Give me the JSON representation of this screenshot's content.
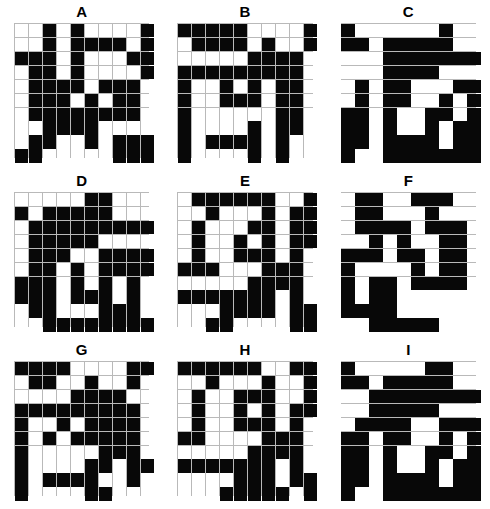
{
  "figure": {
    "title": "",
    "grid_size": 10,
    "panel_count": 9,
    "colors": {
      "filled": "#080808",
      "empty": "#ffffff",
      "gridline": "#b9b9b9",
      "label": "#000000"
    }
  },
  "panels": [
    {
      "label": "A",
      "rows": [
        [
          0,
          0,
          1,
          0,
          1,
          0,
          0,
          0,
          0,
          1
        ],
        [
          0,
          0,
          1,
          0,
          1,
          1,
          1,
          1,
          0,
          1
        ],
        [
          1,
          1,
          1,
          0,
          1,
          0,
          0,
          0,
          1,
          1
        ],
        [
          0,
          1,
          1,
          0,
          1,
          0,
          0,
          0,
          0,
          1
        ],
        [
          0,
          1,
          1,
          1,
          1,
          0,
          1,
          1,
          1,
          0
        ],
        [
          0,
          1,
          1,
          1,
          0,
          1,
          0,
          1,
          1,
          0
        ],
        [
          0,
          1,
          1,
          1,
          1,
          1,
          1,
          1,
          1,
          0
        ],
        [
          0,
          0,
          1,
          1,
          1,
          1,
          0,
          0,
          0,
          0
        ],
        [
          0,
          1,
          1,
          0,
          0,
          1,
          0,
          1,
          1,
          1
        ],
        [
          1,
          1,
          0,
          0,
          0,
          0,
          0,
          1,
          1,
          1
        ]
      ]
    },
    {
      "label": "B",
      "rows": [
        [
          1,
          1,
          1,
          1,
          1,
          0,
          0,
          0,
          0,
          1
        ],
        [
          0,
          1,
          1,
          1,
          1,
          0,
          1,
          0,
          0,
          1
        ],
        [
          0,
          0,
          0,
          0,
          0,
          1,
          1,
          1,
          1,
          0
        ],
        [
          1,
          1,
          1,
          1,
          1,
          1,
          1,
          1,
          1,
          0
        ],
        [
          1,
          0,
          0,
          1,
          0,
          1,
          0,
          1,
          1,
          0
        ],
        [
          1,
          0,
          0,
          1,
          1,
          1,
          0,
          1,
          1,
          0
        ],
        [
          1,
          0,
          0,
          0,
          0,
          0,
          0,
          1,
          1,
          0
        ],
        [
          1,
          0,
          0,
          0,
          0,
          1,
          0,
          1,
          1,
          0
        ],
        [
          1,
          0,
          1,
          1,
          1,
          1,
          0,
          1,
          0,
          0
        ],
        [
          1,
          0,
          0,
          0,
          0,
          1,
          0,
          1,
          0,
          0
        ]
      ]
    },
    {
      "label": "C",
      "rows": [
        [
          1,
          0,
          0,
          0,
          0,
          0,
          0,
          1,
          0,
          0
        ],
        [
          1,
          1,
          0,
          1,
          1,
          1,
          1,
          1,
          0,
          0
        ],
        [
          0,
          0,
          0,
          1,
          1,
          1,
          1,
          1,
          1,
          1
        ],
        [
          0,
          0,
          0,
          1,
          1,
          1,
          1,
          0,
          0,
          0
        ],
        [
          0,
          1,
          0,
          1,
          1,
          0,
          0,
          0,
          1,
          1
        ],
        [
          0,
          1,
          0,
          1,
          1,
          0,
          0,
          1,
          0,
          1
        ],
        [
          1,
          1,
          0,
          1,
          0,
          0,
          1,
          1,
          0,
          1
        ],
        [
          1,
          1,
          0,
          1,
          0,
          0,
          1,
          0,
          1,
          1
        ],
        [
          1,
          1,
          0,
          1,
          1,
          1,
          1,
          0,
          1,
          1
        ],
        [
          1,
          0,
          0,
          1,
          1,
          1,
          1,
          1,
          1,
          1
        ]
      ]
    },
    {
      "label": "D",
      "rows": [
        [
          0,
          0,
          0,
          0,
          0,
          1,
          1,
          0,
          0,
          0
        ],
        [
          1,
          0,
          1,
          1,
          1,
          1,
          1,
          0,
          0,
          0
        ],
        [
          0,
          1,
          1,
          1,
          1,
          1,
          1,
          1,
          1,
          1
        ],
        [
          0,
          1,
          1,
          1,
          1,
          1,
          0,
          0,
          0,
          0
        ],
        [
          0,
          1,
          1,
          1,
          0,
          0,
          1,
          1,
          1,
          1
        ],
        [
          0,
          1,
          1,
          0,
          1,
          0,
          1,
          1,
          1,
          1
        ],
        [
          1,
          1,
          1,
          0,
          1,
          0,
          1,
          0,
          1,
          0
        ],
        [
          1,
          1,
          1,
          0,
          1,
          1,
          1,
          0,
          1,
          0
        ],
        [
          0,
          1,
          1,
          0,
          0,
          0,
          1,
          1,
          1,
          0
        ],
        [
          0,
          0,
          1,
          1,
          1,
          1,
          1,
          1,
          1,
          1
        ]
      ]
    },
    {
      "label": "E",
      "rows": [
        [
          0,
          1,
          1,
          1,
          1,
          1,
          1,
          0,
          0,
          1
        ],
        [
          0,
          0,
          1,
          0,
          0,
          0,
          1,
          0,
          1,
          1
        ],
        [
          0,
          1,
          0,
          0,
          0,
          1,
          1,
          0,
          1,
          1
        ],
        [
          0,
          1,
          0,
          0,
          1,
          0,
          1,
          0,
          1,
          1
        ],
        [
          0,
          1,
          0,
          0,
          1,
          1,
          1,
          0,
          1,
          0
        ],
        [
          1,
          1,
          1,
          0,
          0,
          0,
          1,
          1,
          1,
          0
        ],
        [
          0,
          0,
          0,
          0,
          0,
          1,
          1,
          1,
          1,
          0
        ],
        [
          1,
          1,
          1,
          1,
          1,
          1,
          1,
          0,
          1,
          0
        ],
        [
          0,
          0,
          0,
          1,
          1,
          1,
          1,
          0,
          1,
          1
        ],
        [
          0,
          0,
          1,
          1,
          0,
          0,
          0,
          0,
          1,
          1
        ]
      ]
    },
    {
      "label": "F",
      "rows": [
        [
          0,
          1,
          1,
          0,
          0,
          1,
          1,
          1,
          0,
          0
        ],
        [
          0,
          1,
          1,
          0,
          0,
          0,
          1,
          0,
          0,
          0
        ],
        [
          0,
          1,
          1,
          1,
          1,
          0,
          1,
          1,
          1,
          0
        ],
        [
          0,
          0,
          1,
          0,
          1,
          0,
          0,
          1,
          1,
          0
        ],
        [
          1,
          1,
          1,
          0,
          1,
          1,
          0,
          1,
          1,
          0
        ],
        [
          1,
          0,
          0,
          0,
          0,
          1,
          0,
          1,
          1,
          0
        ],
        [
          1,
          0,
          1,
          1,
          0,
          1,
          1,
          1,
          1,
          0
        ],
        [
          1,
          0,
          1,
          1,
          0,
          0,
          0,
          0,
          0,
          0
        ],
        [
          1,
          1,
          1,
          1,
          0,
          0,
          0,
          0,
          0,
          0
        ],
        [
          0,
          0,
          1,
          1,
          1,
          1,
          1,
          0,
          0,
          0
        ]
      ]
    },
    {
      "label": "G",
      "rows": [
        [
          1,
          1,
          1,
          1,
          0,
          0,
          0,
          0,
          1,
          1
        ],
        [
          0,
          1,
          1,
          0,
          0,
          1,
          0,
          0,
          1,
          0
        ],
        [
          0,
          0,
          0,
          0,
          1,
          1,
          1,
          1,
          0,
          0
        ],
        [
          1,
          1,
          1,
          1,
          1,
          1,
          1,
          1,
          1,
          0
        ],
        [
          1,
          0,
          0,
          1,
          0,
          1,
          1,
          1,
          1,
          0
        ],
        [
          1,
          0,
          1,
          0,
          1,
          1,
          1,
          1,
          1,
          0
        ],
        [
          1,
          0,
          0,
          0,
          0,
          0,
          1,
          1,
          1,
          0
        ],
        [
          1,
          0,
          0,
          0,
          0,
          1,
          1,
          0,
          1,
          1
        ],
        [
          1,
          0,
          1,
          1,
          1,
          1,
          0,
          0,
          1,
          0
        ],
        [
          1,
          0,
          0,
          0,
          0,
          1,
          1,
          0,
          0,
          0
        ]
      ]
    },
    {
      "label": "H",
      "rows": [
        [
          1,
          1,
          1,
          1,
          1,
          1,
          0,
          0,
          1,
          1
        ],
        [
          0,
          0,
          1,
          0,
          0,
          0,
          1,
          0,
          0,
          1
        ],
        [
          0,
          1,
          0,
          0,
          1,
          1,
          1,
          0,
          0,
          1
        ],
        [
          0,
          1,
          0,
          0,
          1,
          0,
          1,
          0,
          1,
          1
        ],
        [
          0,
          1,
          0,
          0,
          1,
          1,
          1,
          0,
          1,
          0
        ],
        [
          1,
          1,
          0,
          0,
          0,
          0,
          1,
          1,
          1,
          0
        ],
        [
          0,
          0,
          0,
          0,
          0,
          1,
          1,
          1,
          1,
          0
        ],
        [
          1,
          1,
          1,
          1,
          1,
          1,
          1,
          0,
          1,
          0
        ],
        [
          0,
          0,
          0,
          0,
          1,
          1,
          1,
          0,
          1,
          1
        ],
        [
          0,
          0,
          0,
          1,
          1,
          1,
          1,
          1,
          0,
          1
        ]
      ]
    },
    {
      "label": "I",
      "rows": [
        [
          1,
          0,
          0,
          0,
          0,
          0,
          1,
          1,
          0,
          0
        ],
        [
          1,
          1,
          0,
          1,
          1,
          1,
          1,
          1,
          0,
          0
        ],
        [
          0,
          0,
          1,
          1,
          1,
          1,
          1,
          1,
          1,
          1
        ],
        [
          0,
          0,
          1,
          1,
          1,
          1,
          1,
          0,
          0,
          0
        ],
        [
          0,
          1,
          1,
          1,
          1,
          0,
          0,
          1,
          1,
          1
        ],
        [
          1,
          1,
          0,
          1,
          1,
          0,
          0,
          1,
          0,
          1
        ],
        [
          1,
          1,
          0,
          1,
          0,
          0,
          1,
          1,
          0,
          1
        ],
        [
          1,
          1,
          0,
          1,
          0,
          0,
          1,
          0,
          1,
          1
        ],
        [
          1,
          1,
          0,
          1,
          1,
          1,
          1,
          0,
          1,
          1
        ],
        [
          1,
          0,
          0,
          1,
          1,
          1,
          1,
          1,
          1,
          1
        ]
      ]
    }
  ]
}
